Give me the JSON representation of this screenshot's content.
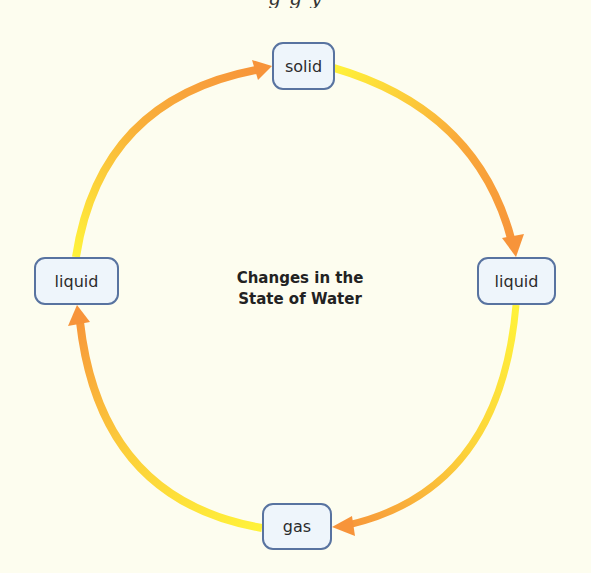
{
  "header": {
    "clipped_text": "g         g                              y"
  },
  "diagram": {
    "title_line1": "Changes in the",
    "title_line2": "State of Water",
    "nodes": {
      "top": "solid",
      "right": "liquid",
      "bottom": "gas",
      "left": "liquid"
    },
    "cycle_order": [
      "solid",
      "liquid",
      "gas",
      "liquid"
    ],
    "colors": {
      "background": "#fdfdef",
      "node_fill": "#eef5fb",
      "node_border": "#5873a0",
      "arrow_start": "#fff23a",
      "arrow_end": "#f7943a"
    }
  }
}
